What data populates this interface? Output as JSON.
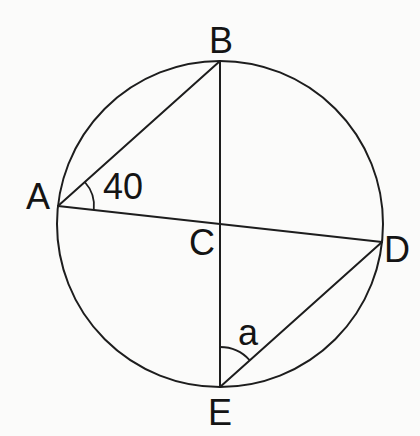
{
  "figure": {
    "background_color": "#fbfbfa",
    "line_color": "#1d1d1d",
    "labels": {
      "A": {
        "text": "A",
        "x": 38,
        "y": 209
      },
      "B": {
        "text": "B",
        "x": 221,
        "y": 53
      },
      "C": {
        "text": "C",
        "x": 202,
        "y": 255
      },
      "D": {
        "text": "D",
        "x": 397,
        "y": 262
      },
      "E": {
        "text": "E",
        "x": 220,
        "y": 425
      },
      "angle_A": {
        "text": "40",
        "x": 123,
        "y": 199
      },
      "angle_E": {
        "text": "a",
        "x": 248,
        "y": 345
      }
    },
    "geometry": {
      "circle": {
        "cx": 220,
        "cy": 224,
        "r": 163
      },
      "points": {
        "A": [
          58,
          206
        ],
        "B": [
          220,
          61
        ],
        "C": [
          220,
          224
        ],
        "D": [
          382,
          242
        ],
        "E": [
          220,
          387
        ]
      },
      "angle_arcs": {
        "at_A": {
          "path": "M 84.8 182.0 A 36 36 0 0 1 93.8 210.0",
          "value": "40"
        },
        "at_E": {
          "path": "M 220 347 A 40 40 0 0 1 249.8 360.3",
          "value": "a"
        }
      }
    }
  }
}
